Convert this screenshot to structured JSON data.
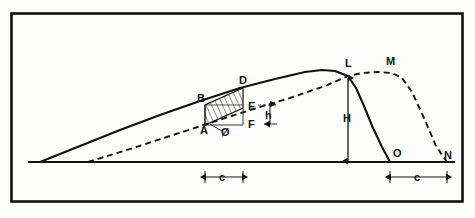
{
  "figure": {
    "background_color": "#fdfdfc",
    "ink_color": "#111111",
    "frame": {
      "x": 10,
      "y": 12,
      "width": 454,
      "height": 191,
      "stroke_width": 2.5
    },
    "labels": [
      {
        "id": "A",
        "text": "A",
        "x": 200,
        "y": 134,
        "role": "vertex-label"
      },
      {
        "id": "B",
        "text": "B",
        "x": 197,
        "y": 102,
        "role": "vertex-label"
      },
      {
        "id": "D",
        "text": "D",
        "x": 239,
        "y": 84,
        "role": "vertex-label"
      },
      {
        "id": "E",
        "text": "E",
        "x": 248,
        "y": 110,
        "role": "vertex-label"
      },
      {
        "id": "F",
        "text": "F",
        "x": 248,
        "y": 128,
        "role": "vertex-label"
      },
      {
        "id": "phi",
        "text": "Ø",
        "x": 221,
        "y": 134,
        "role": "angle-label"
      },
      {
        "id": "h",
        "text": "h",
        "x": 265,
        "y": 119,
        "role": "dimension-label"
      },
      {
        "id": "H",
        "text": "H",
        "x": 343,
        "y": 122,
        "role": "dimension-label"
      },
      {
        "id": "L",
        "text": "L",
        "x": 345,
        "y": 67,
        "role": "vertex-label"
      },
      {
        "id": "M",
        "text": "M",
        "x": 386,
        "y": 65,
        "role": "vertex-label"
      },
      {
        "id": "O",
        "text": "O",
        "x": 393,
        "y": 157,
        "role": "vertex-label"
      },
      {
        "id": "N",
        "text": "N",
        "x": 444,
        "y": 159,
        "role": "vertex-label"
      },
      {
        "id": "c-left",
        "text": "c",
        "x": 219,
        "y": 181,
        "role": "dimension-label"
      },
      {
        "id": "c-right",
        "text": "c",
        "x": 414,
        "y": 181,
        "role": "dimension-label"
      }
    ],
    "dimensions": [
      {
        "id": "c-left",
        "label": "c",
        "from_x": 205,
        "to_x": 243,
        "y": 177,
        "orientation": "horizontal"
      },
      {
        "id": "c-right",
        "label": "c",
        "from_x": 390,
        "to_x": 447,
        "y": 177,
        "orientation": "horizontal"
      },
      {
        "id": "H",
        "label": "H",
        "x": 348,
        "from_y": 78,
        "to_y": 161,
        "orientation": "vertical"
      },
      {
        "id": "h",
        "label": "h",
        "x": 270,
        "from_y": 105,
        "to_y": 124,
        "orientation": "vertical"
      }
    ],
    "baseline": {
      "x1": 28,
      "y1": 162,
      "x2": 455,
      "y2": 162
    },
    "solid_curve": {
      "name": "solid-profile",
      "style": "solid",
      "points": "40,162 80,146 120,130 160,115 200,101 240,88 275,79 305,72 322,70 335,71 348,76 358,92 368,116 380,142 390,162"
    },
    "dashed_curve": {
      "name": "dashed-profile",
      "style": "dashed",
      "points": "88,162 130,149 170,136 210,123 250,110 290,98 325,86 348,76 362,73 378,72 392,73 402,78 412,92 424,118 436,146 447,162"
    },
    "shaded_region": {
      "name": "hatched-parallelogram",
      "vertices": "205,125 205,105 243,88 243,108",
      "fill": "hatch"
    },
    "rect_AF": {
      "name": "reference-rectangle",
      "vertices": "205,125 243,125 243,108"
    }
  }
}
